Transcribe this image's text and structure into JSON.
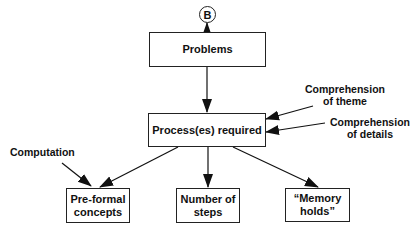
{
  "diagram": {
    "connector": {
      "label": "B"
    },
    "nodes": {
      "problems": {
        "label": "Problems"
      },
      "process": {
        "label": "Process(es) required"
      },
      "preformal": {
        "line1": "Pre-formal",
        "line2": "concepts"
      },
      "steps": {
        "line1": "Number of",
        "line2": "steps"
      },
      "memory": {
        "line1": "“Memory",
        "line2": "holds”"
      }
    },
    "inputs": {
      "theme": {
        "line1": "Comprehension",
        "line2": "of theme"
      },
      "details": {
        "line1": "Comprehension",
        "line2": "of details"
      },
      "computation": {
        "label": "Computation"
      }
    },
    "edges": [
      {
        "from": "connector",
        "to": "problems"
      },
      {
        "from": "problems",
        "to": "process"
      },
      {
        "from": "comprehension-of-theme",
        "to": "process"
      },
      {
        "from": "comprehension-of-details",
        "to": "process"
      },
      {
        "from": "process",
        "to": "preformal"
      },
      {
        "from": "process",
        "to": "steps"
      },
      {
        "from": "process",
        "to": "memory"
      },
      {
        "from": "computation",
        "to": "preformal"
      }
    ]
  }
}
